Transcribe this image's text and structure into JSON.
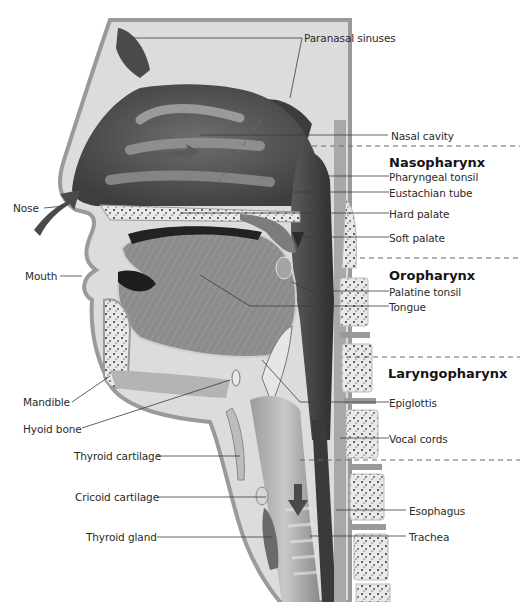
{
  "diagram": {
    "type": "anatomical cross-section",
    "palette": {
      "background": "#ffffff",
      "label_text": "#2a2a2a",
      "region_text": "#141414",
      "leader_line": "#3a3a3a",
      "cavity_dark": "#4a4a4a",
      "tissue_mid": "#8a8a8a",
      "bone_light": "#e4e4e4",
      "outline": "#9a9a9a"
    }
  },
  "regions": [
    {
      "id": "nasopharynx",
      "label": "Nasopharynx"
    },
    {
      "id": "oropharynx",
      "label": "Oropharynx"
    },
    {
      "id": "laryngopharynx",
      "label": "Laryngopharynx"
    }
  ],
  "labels_right": [
    {
      "id": "paranasal-sinuses",
      "text": "Paranasal sinuses"
    },
    {
      "id": "nasal-cavity",
      "text": "Nasal cavity"
    },
    {
      "id": "pharyngeal-tonsil",
      "text": "Pharyngeal tonsil"
    },
    {
      "id": "eustachian-tube",
      "text": "Eustachian tube"
    },
    {
      "id": "hard-palate",
      "text": "Hard palate"
    },
    {
      "id": "soft-palate",
      "text": "Soft palate"
    },
    {
      "id": "palatine-tonsil",
      "text": "Palatine tonsil"
    },
    {
      "id": "tongue",
      "text": "Tongue"
    },
    {
      "id": "epiglottis",
      "text": "Epiglottis"
    },
    {
      "id": "vocal-cords",
      "text": "Vocal cords"
    },
    {
      "id": "esophagus",
      "text": "Esophagus"
    },
    {
      "id": "trachea",
      "text": "Trachea"
    }
  ],
  "labels_left": [
    {
      "id": "nose",
      "text": "Nose"
    },
    {
      "id": "mouth",
      "text": "Mouth"
    },
    {
      "id": "mandible",
      "text": "Mandible"
    },
    {
      "id": "hyoid-bone",
      "text": "Hyoid bone"
    },
    {
      "id": "thyroid-cartilage",
      "text": "Thyroid cartilage"
    },
    {
      "id": "cricoid-cartilage",
      "text": "Cricoid cartilage"
    },
    {
      "id": "thyroid-gland",
      "text": "Thyroid gland"
    }
  ],
  "arrows": [
    {
      "id": "airflow-nose-in",
      "meaning": "air entering nose"
    },
    {
      "id": "airflow-nasal-cavity",
      "meaning": "air through nasal cavity"
    },
    {
      "id": "airflow-nasopharynx-down",
      "meaning": "air down the pharynx"
    },
    {
      "id": "airflow-trachea-down",
      "meaning": "air down the trachea"
    }
  ]
}
